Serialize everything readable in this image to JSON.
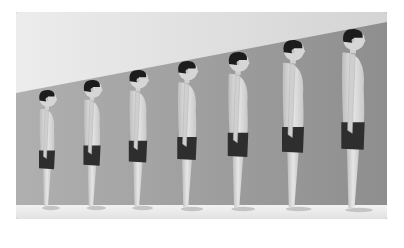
{
  "image": {
    "description": "Illustration of seven male figures shown in profile, standing in a row, increasing in height from a young child (left) to an adult man (right), depicting human growth",
    "figure_count": 7,
    "colors": {
      "wall_light": "#e6e6e6",
      "wall_dark": "#9a9a9a",
      "floor": "#ececec",
      "skin": "#d9d9d9",
      "shorts": "#2e2e2e",
      "hair": "#1c1c1c"
    },
    "figures": [
      {
        "label": "figure-1",
        "cx": 31,
        "head_top": 78,
        "feet": 198
      },
      {
        "label": "figure-2",
        "cx": 76,
        "head_top": 68,
        "feet": 198
      },
      {
        "label": "figure-3",
        "cx": 122,
        "head_top": 58,
        "feet": 198
      },
      {
        "label": "figure-4",
        "cx": 171,
        "head_top": 49,
        "feet": 199
      },
      {
        "label": "figure-5",
        "cx": 222,
        "head_top": 40,
        "feet": 199
      },
      {
        "label": "figure-6",
        "cx": 277,
        "head_top": 28,
        "feet": 199
      },
      {
        "label": "figure-7",
        "cx": 337,
        "head_top": 17,
        "feet": 200
      }
    ]
  }
}
